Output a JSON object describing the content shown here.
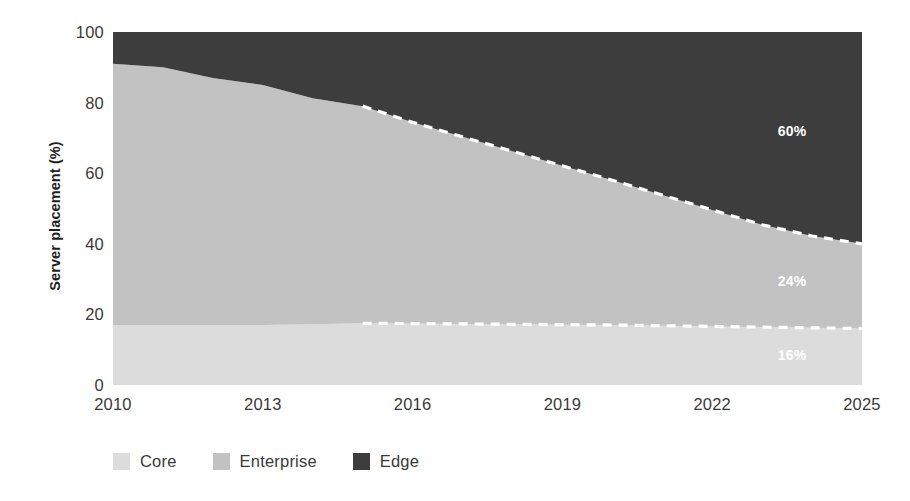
{
  "chart_data": {
    "type": "area",
    "title": "",
    "subtitle": "",
    "xlabel": "",
    "ylabel": "Server placement (%)",
    "xlim": [
      2010,
      2025
    ],
    "ylim": [
      0,
      100
    ],
    "grid": false,
    "stacked": true,
    "legend_position": "bottom-left",
    "x": [
      2010,
      2011,
      2012,
      2013,
      2014,
      2015,
      2016,
      2017,
      2018,
      2019,
      2020,
      2021,
      2022,
      2023,
      2024,
      2025
    ],
    "xticks": [
      "2010",
      "2013",
      "2016",
      "2019",
      "2022",
      "2025"
    ],
    "xtick_values": [
      2010,
      2013,
      2016,
      2019,
      2022,
      2025
    ],
    "yticks": [
      "0",
      "20",
      "40",
      "60",
      "80",
      "100"
    ],
    "ytick_values": [
      0,
      20,
      40,
      60,
      80,
      100
    ],
    "forecast_start_year": 2015,
    "series": [
      {
        "name": "Core",
        "color": "#dcdcdc",
        "values": [
          17,
          17,
          17,
          17,
          17.2,
          17.5,
          17.4,
          17.3,
          17.2,
          17.1,
          17.0,
          16.8,
          16.6,
          16.4,
          16.2,
          16
        ]
      },
      {
        "name": "Enterprise",
        "color": "#c2c2c2",
        "values": [
          74,
          73,
          70,
          68,
          64,
          61.5,
          57,
          53,
          49,
          45,
          41,
          37,
          33,
          29,
          26,
          24
        ]
      },
      {
        "name": "Edge",
        "color": "#3d3d3d",
        "values": [
          9,
          10,
          13,
          15,
          18.8,
          21,
          25.6,
          29.7,
          33.8,
          37.9,
          42,
          46.2,
          50.4,
          54.6,
          57.8,
          60
        ]
      }
    ],
    "cumulative_tops": {
      "core": [
        17,
        17,
        17,
        17,
        17.2,
        17.5,
        17.4,
        17.3,
        17.2,
        17.1,
        17.0,
        16.8,
        16.6,
        16.4,
        16.2,
        16
      ],
      "enterprise": [
        91,
        90,
        87,
        85,
        81.2,
        79,
        74.4,
        70.3,
        66.2,
        62.1,
        58,
        53.8,
        49.6,
        45.4,
        42.2,
        40
      ]
    },
    "annotations": [
      {
        "name": "edge-value-label",
        "text": "60%",
        "series": "Edge",
        "value": 60,
        "x": 2023.6,
        "y": 72
      },
      {
        "name": "enterprise-value-label",
        "text": "24%",
        "series": "Enterprise",
        "value": 24,
        "x": 2023.6,
        "y": 29.5
      },
      {
        "name": "core-value-label",
        "text": "16%",
        "series": "Core",
        "value": 16,
        "x": 2023.6,
        "y": 8.5
      }
    ],
    "forecast_dividers": [
      {
        "name": "enterprise-edge-boundary",
        "style": "dashed",
        "color": "#ffffff"
      },
      {
        "name": "core-enterprise-boundary",
        "style": "dashed",
        "color": "#ffffff"
      }
    ]
  },
  "legend": {
    "items": [
      {
        "label": "Core",
        "color": "#dcdcdc"
      },
      {
        "label": "Enterprise",
        "color": "#c2c2c2"
      },
      {
        "label": "Edge",
        "color": "#3d3d3d"
      }
    ]
  }
}
